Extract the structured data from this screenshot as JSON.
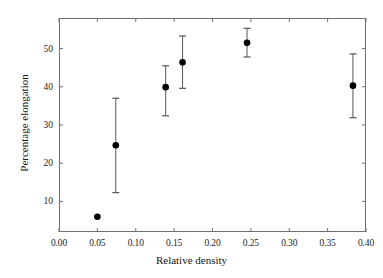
{
  "chart_data": {
    "type": "scatter",
    "title": "",
    "xlabel": "Relative density",
    "ylabel": "Percentage elongation",
    "xlim": [
      0.0,
      0.4
    ],
    "ylim": [
      2.0,
      58.0
    ],
    "grid": false,
    "legend": null,
    "xticks": [
      0.0,
      0.05,
      0.1,
      0.15,
      0.2,
      0.25,
      0.3,
      0.35,
      0.4
    ],
    "xticklabels": [
      "0.00",
      "0.05",
      "0.10",
      "0.15",
      "0.20",
      "0.25",
      "0.30",
      "0.35",
      "0.40"
    ],
    "yticks": [
      10,
      20,
      30,
      40,
      50
    ],
    "yticklabels": [
      "10",
      "20",
      "30",
      "40",
      "50"
    ],
    "marker": "filled-circle",
    "marker_color": "#000000",
    "errorbar_color": "#555555",
    "errorbars": "vertical-with-caps",
    "x": [
      0.05,
      0.074,
      0.139,
      0.161,
      0.245,
      0.383
    ],
    "y": [
      6.0,
      24.7,
      39.9,
      46.4,
      51.5,
      40.3
    ],
    "yerr_low": [
      6.0,
      12.3,
      32.4,
      39.6,
      47.8,
      31.9
    ],
    "yerr_high": [
      6.0,
      37.0,
      45.5,
      53.3,
      55.3,
      48.6
    ],
    "points": [
      {
        "x": 0.05,
        "y": 6.0,
        "low": 6.0,
        "high": 6.0
      },
      {
        "x": 0.074,
        "y": 24.7,
        "low": 12.3,
        "high": 37.0
      },
      {
        "x": 0.139,
        "y": 39.9,
        "low": 32.4,
        "high": 45.5
      },
      {
        "x": 0.161,
        "y": 46.4,
        "low": 39.6,
        "high": 53.3
      },
      {
        "x": 0.245,
        "y": 51.5,
        "low": 47.8,
        "high": 55.3
      },
      {
        "x": 0.383,
        "y": 40.3,
        "low": 31.9,
        "high": 48.6
      }
    ]
  },
  "axes": {
    "x_axis_label": "Relative density",
    "y_axis_label": "Percentage elongation"
  }
}
